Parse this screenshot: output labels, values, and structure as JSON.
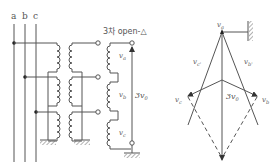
{
  "circuit": {
    "phase_labels": [
      "a",
      "b",
      "c"
    ],
    "title": "3차 open-△",
    "winding_labels": [
      "v",
      "v",
      "v"
    ],
    "winding_subs": [
      "a",
      "b",
      "c"
    ],
    "output_label": "3v",
    "output_sub": "0"
  },
  "phasor": {
    "vertex_labels": {
      "top": "v",
      "top_sub": "a",
      "left": "v",
      "left_sub": "c",
      "right": "v",
      "right_sub": "b"
    },
    "edge_labels": {
      "left": "v",
      "left_sub": "c'",
      "right": "v",
      "right_sub": "b'"
    },
    "resultant": "3v",
    "resultant_sub": "0"
  },
  "colors": {
    "line": "#555555",
    "background": "#ffffff"
  }
}
